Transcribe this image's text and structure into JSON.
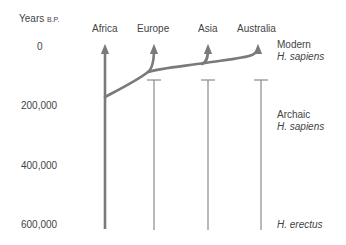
{
  "axis": {
    "title": "Years",
    "title_suffix": "B.P.",
    "ticks": [
      "0",
      "200,000",
      "400,000",
      "600,000"
    ]
  },
  "regions": [
    "Africa",
    "Europe",
    "Asia",
    "Australia"
  ],
  "stages": [
    {
      "line1": "Modern",
      "line2": "H. sapiens"
    },
    {
      "line1": "Archaic",
      "line2": "H. sapiens"
    },
    {
      "line1": "",
      "line2": "H. erectus"
    }
  ],
  "colors": {
    "line": "#7a7a7a",
    "text": "#444444"
  }
}
